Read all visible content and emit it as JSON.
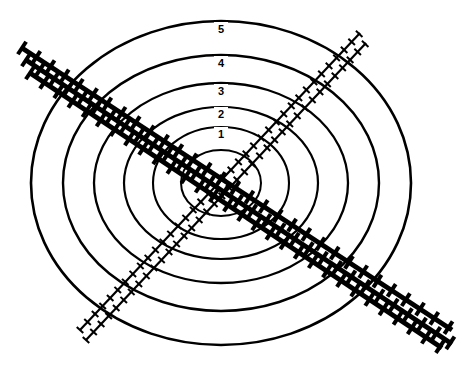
{
  "diagram": {
    "background_color": "#ffffff",
    "stroke_color": "#000000",
    "width": 472,
    "height": 374,
    "center": {
      "x": 221,
      "y": 183
    },
    "rings": [
      {
        "label": "5",
        "rx": 190,
        "ry": 162,
        "label_x": 221,
        "label_y": 30,
        "stroke_width": 2.6
      },
      {
        "label": "4",
        "rx": 158,
        "ry": 128,
        "label_x": 221,
        "label_y": 64,
        "stroke_width": 2.4
      },
      {
        "label": "3",
        "rx": 127,
        "ry": 100,
        "label_x": 221,
        "label_y": 92,
        "stroke_width": 2.3
      },
      {
        "label": "2",
        "rx": 97,
        "ry": 76,
        "label_x": 221,
        "label_y": 115,
        "stroke_width": 2.2
      },
      {
        "label": "1",
        "rx": 68,
        "ry": 56,
        "label_x": 221,
        "label_y": 135,
        "stroke_width": 2.1
      },
      {
        "label": "",
        "rx": 40,
        "ry": 33,
        "label_x": 221,
        "label_y": 152,
        "stroke_width": 2.0
      }
    ],
    "ring_labels": [
      "5",
      "4",
      "3",
      "2",
      "1"
    ],
    "railways": [
      {
        "name": "railway-main-north",
        "orientation": "northwest-southeast",
        "x1": 22,
        "y1": 48,
        "x2": 452,
        "y2": 330,
        "rail_width": 5.0,
        "tie_length": 15,
        "tie_width": 4.0,
        "tie_spacing": 17,
        "weight": "heavy"
      },
      {
        "name": "railway-main-middle",
        "orientation": "northwest-southeast",
        "x1": 26,
        "y1": 60,
        "x2": 452,
        "y2": 344,
        "rail_width": 5.0,
        "tie_length": 15,
        "tie_width": 4.0,
        "tie_spacing": 17,
        "weight": "heavy"
      },
      {
        "name": "railway-main-south",
        "orientation": "northwest-southeast",
        "x1": 30,
        "y1": 73,
        "x2": 442,
        "y2": 348,
        "rail_width": 5.0,
        "tie_length": 15,
        "tie_width": 4.0,
        "tie_spacing": 17,
        "weight": "heavy"
      },
      {
        "name": "railway-branch-upper",
        "orientation": "southwest-northeast",
        "x1": 80,
        "y1": 330,
        "x2": 360,
        "y2": 33,
        "rail_width": 2.2,
        "tie_length": 9,
        "tie_width": 2.0,
        "tie_spacing": 11,
        "weight": "light"
      },
      {
        "name": "railway-branch-lower",
        "orientation": "southwest-northeast",
        "x1": 86,
        "y1": 340,
        "x2": 366,
        "y2": 43,
        "rail_width": 2.2,
        "tie_length": 9,
        "tie_width": 2.0,
        "tie_spacing": 11,
        "weight": "light"
      }
    ]
  }
}
